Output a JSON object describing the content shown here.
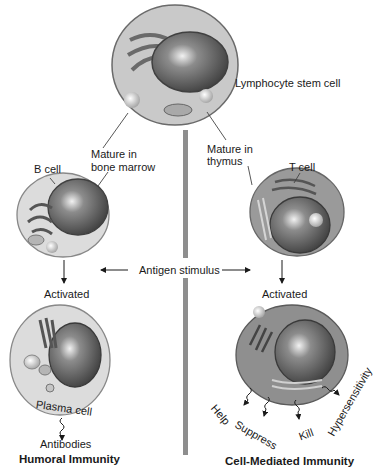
{
  "diagram": {
    "title_cells": {
      "stem": "Lymphocyte stem cell",
      "b_cell": "B cell",
      "t_cell": "T cell",
      "plasma_cell": "Plasma cell"
    },
    "maturation": {
      "bone_marrow_line1": "Mature in",
      "bone_marrow_line2": "bone marrow",
      "thymus_line1": "Mature in",
      "thymus_line2": "thymus"
    },
    "stimulus": "Antigen stimulus",
    "left": {
      "activated": "Activated",
      "output": "Antibodies",
      "heading": "Humoral Immunity"
    },
    "right": {
      "activated": "Activated",
      "outputs": [
        "Help",
        "Suppress",
        "Kill",
        "Hypersensitivity"
      ],
      "heading": "Cell-Mediated Immunity"
    },
    "colors": {
      "cell_light": "#d9d9d9",
      "cell_dark": "#8a8a8a",
      "nucleus": "#555555",
      "divider": "#8e8e8e",
      "text": "#1a1a1a"
    }
  }
}
